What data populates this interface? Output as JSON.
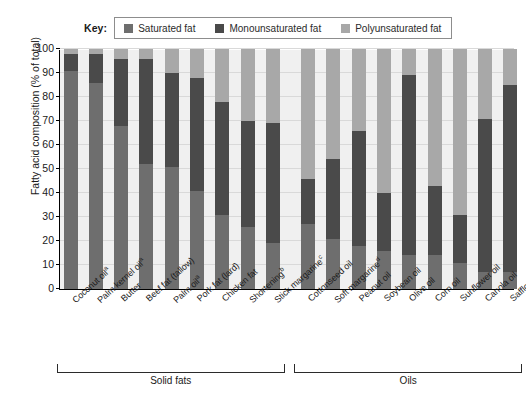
{
  "legend": {
    "key_label": "Key:",
    "entries": [
      {
        "label": "Saturated fat",
        "color": "#6e6e6e"
      },
      {
        "label": "Monounsaturated fat",
        "color": "#4a4a4a"
      },
      {
        "label": "Polyunsaturated fat",
        "color": "#a8a8a8"
      }
    ]
  },
  "axes": {
    "ylabel": "Fatty acid composition  (% of total)",
    "yticks": [
      0,
      10,
      20,
      30,
      40,
      50,
      60,
      70,
      80,
      90,
      100
    ]
  },
  "groups": [
    {
      "name": "Solid fats",
      "start": 0,
      "end": 8
    },
    {
      "name": "Oils",
      "start": 9,
      "end": 17
    }
  ],
  "chart_data": {
    "type": "bar",
    "title": "",
    "xlabel": "",
    "ylabel": "Fatty acid composition  (% of total)",
    "ylim": [
      0,
      100
    ],
    "grid": true,
    "legend_position": "top",
    "stacked": true,
    "categories": [
      "Coconut oilᵃ",
      "Palm kernel oilᵃ",
      "Butter",
      "Beef fat (tallow)",
      "Palm oilᵃ",
      "Pork fat (lard)",
      "Chicken fat",
      "Shorteningᵇ",
      "Stick margarineᶜ",
      "Cottonseed oil",
      "Soft margarineᵈ",
      "Peanut oil",
      "Soybean oil",
      "Olive oil",
      "Corn oil",
      "Sunflower oil",
      "Canola oil",
      "Safflower oil"
    ],
    "category_labels_html": [
      "Coconut oil<sup>a</sup>",
      "Palm kernel oil<sup>a</sup>",
      "Butter",
      "Beef fat (tallow)",
      "Palm oil<sup>a</sup>",
      "Pork fat (lard)",
      "Chicken fat",
      "Shortening<sup>b</sup>",
      "Stick margarine<sup>c</sup>",
      "Cottonseed oil",
      "Soft margarine<sup>d</sup>",
      "Peanut oil",
      "Soybean oil",
      "Olive oil",
      "Corn oil",
      "Sunflower oil",
      "Canola oil",
      "Safflower oil"
    ],
    "series": [
      {
        "name": "Saturated fat",
        "color": "#6e6e6e",
        "values": [
          91,
          86,
          68,
          52,
          51,
          41,
          31,
          26,
          19,
          27,
          21,
          18,
          16,
          14,
          14,
          11,
          7,
          7
        ]
      },
      {
        "name": "Monounsaturated fat",
        "color": "#4a4a4a",
        "values": [
          7,
          12,
          28,
          44,
          39,
          47,
          47,
          44,
          50,
          19,
          33,
          48,
          24,
          75,
          29,
          20,
          64,
          78
        ]
      },
      {
        "name": "Polyunsaturated fat",
        "color": "#a8a8a8",
        "values": [
          2,
          2,
          4,
          4,
          10,
          12,
          22,
          30,
          31,
          54,
          46,
          34,
          60,
          11,
          57,
          69,
          29,
          15
        ]
      }
    ]
  }
}
